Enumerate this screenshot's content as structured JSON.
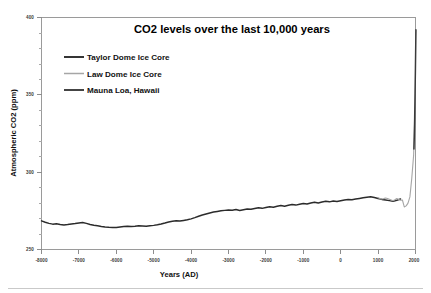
{
  "figure": {
    "title": "CO2 levels over the last 10,000 years",
    "xlabel": "Years (AD)",
    "ylabel": "Atmospheric CO2 (ppm)"
  },
  "legend": {
    "items": [
      {
        "label": "Taylor Dome Ice Core",
        "color": "#2b2b2b",
        "width": 1.9
      },
      {
        "label": "Law Dome Ice Core",
        "color": "#a6a6a6",
        "width": 1.5
      },
      {
        "label": "Mauna Loa, Hawaii",
        "color": "#3a3a3a",
        "width": 1.9
      }
    ]
  },
  "axes": {
    "y_ticks": [
      "400",
      "350",
      "300",
      "250"
    ],
    "x_ticks": [
      "-8000",
      "-7000",
      "-6000",
      "-5000",
      "-4000",
      "-3000",
      "-2000",
      "-1000",
      "0",
      "1000",
      "2000"
    ]
  },
  "chart_data": {
    "type": "line",
    "title": "CO2 levels over the last 10,000 years",
    "xlabel": "Years (AD)",
    "ylabel": "Atmospheric CO2 (ppm)",
    "xlim": [
      -8000,
      2000
    ],
    "ylim": [
      250,
      400
    ],
    "grid": false,
    "legend_position": "upper-left",
    "y_ticks": [
      250,
      300,
      350,
      400
    ],
    "y_minor_tick_step": 10,
    "x_ticks": [
      -8000,
      -7000,
      -6000,
      -5000,
      -4000,
      -3000,
      -2000,
      -1000,
      0,
      1000,
      2000
    ],
    "series": [
      {
        "name": "Taylor Dome Ice Core",
        "color": "#2b2b2b",
        "x": [
          -8000,
          -7900,
          -7800,
          -7700,
          -7600,
          -7500,
          -7400,
          -7300,
          -7200,
          -7100,
          -7000,
          -6900,
          -6800,
          -6700,
          -6600,
          -6500,
          -6400,
          -6300,
          -6200,
          -6100,
          -6000,
          -5900,
          -5800,
          -5700,
          -5600,
          -5500,
          -5400,
          -5300,
          -5200,
          -5100,
          -5000,
          -4900,
          -4800,
          -4700,
          -4600,
          -4500,
          -4400,
          -4300,
          -4200,
          -4100,
          -4000,
          -3900,
          -3800,
          -3700,
          -3600,
          -3500,
          -3400,
          -3300,
          -3200,
          -3100,
          -3000,
          -2900,
          -2800,
          -2700,
          -2600,
          -2500,
          -2400,
          -2300,
          -2200,
          -2100,
          -2000,
          -1900,
          -1800,
          -1700,
          -1600,
          -1500,
          -1400,
          -1300,
          -1200,
          -1100,
          -1000,
          -900,
          -800,
          -700,
          -600,
          -500,
          -400,
          -300,
          -200,
          -100,
          0,
          100,
          200,
          300,
          400,
          500,
          600,
          700,
          800,
          900,
          1000,
          1100,
          1200,
          1300,
          1400,
          1500,
          1600
        ],
        "y": [
          268.5,
          267.6,
          266.9,
          266.4,
          266.6,
          266.2,
          265.9,
          266.1,
          266.5,
          266.8,
          267.2,
          267.5,
          266.9,
          266.2,
          265.7,
          265.3,
          264.9,
          264.6,
          264.4,
          264.3,
          264.2,
          264.5,
          264.8,
          265.0,
          264.9,
          265.1,
          265.4,
          265.2,
          265.0,
          265.3,
          265.6,
          266.0,
          266.5,
          267.1,
          267.8,
          268.3,
          268.6,
          268.4,
          268.8,
          269.2,
          269.8,
          270.6,
          271.5,
          272.3,
          273.0,
          273.6,
          274.2,
          274.6,
          275.0,
          275.3,
          275.6,
          275.4,
          275.8,
          275.2,
          275.7,
          276.2,
          276.0,
          276.5,
          277.0,
          276.6,
          277.1,
          277.6,
          277.3,
          277.9,
          278.4,
          278.0,
          278.6,
          279.1,
          278.7,
          279.3,
          279.8,
          279.4,
          280.0,
          280.5,
          280.1,
          280.7,
          281.2,
          280.8,
          281.3,
          281.0,
          281.5,
          282.0,
          282.4,
          282.1,
          282.6,
          283.0,
          283.4,
          283.8,
          284.1,
          283.6,
          283.0,
          282.4,
          282.0,
          281.6,
          281.2,
          281.8,
          282.6
        ]
      },
      {
        "name": "Law Dome Ice Core",
        "color": "#a6a6a6",
        "x": [
          1000,
          1050,
          1100,
          1150,
          1200,
          1250,
          1300,
          1350,
          1400,
          1450,
          1500,
          1550,
          1600,
          1650,
          1700,
          1750,
          1800,
          1850,
          1900,
          1950,
          1975
        ],
        "y": [
          283.4,
          283.0,
          282.6,
          282.9,
          283.3,
          283.0,
          282.5,
          282.0,
          281.5,
          282.2,
          283.0,
          282.4,
          281.8,
          282.0,
          277.5,
          278.2,
          280.0,
          284.0,
          296.0,
          311.0,
          331.0
        ]
      },
      {
        "name": "Mauna Loa, Hawaii",
        "color": "#3a3a3a",
        "x": [
          1958,
          1968,
          1978,
          1988,
          1998,
          2008,
          2012
        ],
        "y": [
          315.0,
          323.0,
          335.0,
          351.0,
          367.0,
          385.0,
          392.0
        ]
      }
    ],
    "annotations": [
      "Pre-industrial CO2 fluctuates between roughly 260 and 285 ppm",
      "Sharp industrial-era rise to nearly 390 ppm near year 2000"
    ]
  }
}
